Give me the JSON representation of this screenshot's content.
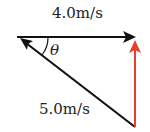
{
  "diagram": {
    "labels": {
      "top_vector": "4.0m/s",
      "diagonal_vector": "5.0m/s",
      "angle": "θ"
    },
    "colors": {
      "black_vector": "#111111",
      "red_vector": "#e8402a"
    }
  }
}
